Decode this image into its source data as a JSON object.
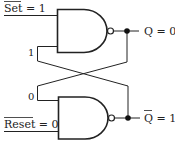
{
  "diagram": {
    "type": "SR latch (cross-coupled NAND)",
    "inputs": {
      "set": {
        "name": "Set",
        "overbar": true,
        "value": "1",
        "label": "Set = 1"
      },
      "reset": {
        "name": "Reset",
        "overbar": true,
        "value": "0",
        "label": "Reset = 0"
      }
    },
    "outputs": {
      "q": {
        "name": "Q",
        "overbar": false,
        "value": "0",
        "label": "Q = 0"
      },
      "qbar": {
        "name": "Q",
        "overbar": true,
        "value": "1",
        "label": "Q = 1"
      }
    },
    "feedback": {
      "top_gate_input": "1",
      "bottom_gate_input": "0"
    },
    "gates": [
      {
        "id": "top-nand",
        "type": "NAND"
      },
      {
        "id": "bottom-nand",
        "type": "NAND"
      }
    ],
    "colors": {
      "stroke": "#222222",
      "background": "#ffffff"
    }
  },
  "text": {
    "set_name": "Set",
    "set_eq": " = 1",
    "reset_name": "Reset",
    "reset_eq": " = 0",
    "q_label": "Q = 0",
    "qbar_name": "Q",
    "qbar_eq": " = 1",
    "fb_top": "1",
    "fb_bottom": "0"
  }
}
